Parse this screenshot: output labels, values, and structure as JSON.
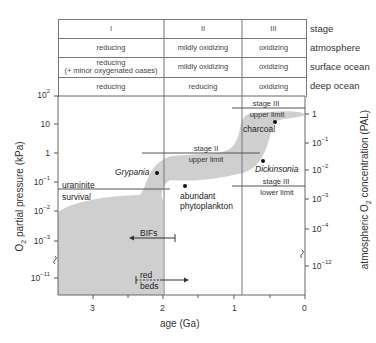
{
  "table": {
    "columns": [
      "I",
      "II",
      "III"
    ],
    "rows": [
      {
        "label": "stage",
        "cells": [
          "I",
          "II",
          "III"
        ]
      },
      {
        "label": "atmosphere",
        "cells": [
          "reducing",
          "mildly oxidizing",
          "oxidizing"
        ]
      },
      {
        "label": "surface ocean",
        "cells": [
          "reducing",
          "mildly oxidizing",
          "oxidizing"
        ],
        "note": "(+ minor oxygenated oases)"
      },
      {
        "label": "deep ocean",
        "cells": [
          "reducing",
          "reducing",
          "oxidizing"
        ]
      }
    ]
  },
  "chart": {
    "xlabel": "age (Ga)",
    "ylabel_left_main": "O",
    "ylabel_left_sub": "2",
    "ylabel_left_rest": " partial pressure (kPa)",
    "ylabel_right_pre": "atmospheric O",
    "ylabel_right_sub": "2",
    "ylabel_right_rest": " concentration (PAL)",
    "x_ticks": [
      "3",
      "2",
      "1",
      "0"
    ],
    "left_ticks": [
      {
        "base": "10",
        "exp": "2"
      },
      {
        "base": "10",
        "exp": ""
      },
      {
        "base": "1",
        "exp": ""
      },
      {
        "base": "10",
        "exp": "−1"
      },
      {
        "base": "10",
        "exp": "−2"
      },
      {
        "base": "10",
        "exp": "−3"
      },
      {
        "base": "10",
        "exp": "−11"
      }
    ],
    "right_ticks": [
      {
        "base": "1",
        "exp": ""
      },
      {
        "base": "10",
        "exp": "−1"
      },
      {
        "base": "10",
        "exp": "−2"
      },
      {
        "base": "10",
        "exp": "−3"
      },
      {
        "base": "10",
        "exp": "−4"
      },
      {
        "base": "10",
        "exp": "−12"
      }
    ],
    "annotations": {
      "uraninite": "uraninite",
      "survival": "survival",
      "grypania": "Grypania",
      "abundant": "abundant",
      "phytoplankton": "phytoplankton",
      "stage2_upper_1": "stage II",
      "stage2_upper_2": "upper limit",
      "stage3_upper_1": "stage III",
      "stage3_upper_2": "upper limit",
      "charcoal": "charcoal",
      "dickinsonia": "Dickinsonia",
      "stage3_lower_1": "stage III",
      "stage3_lower_2": "lower limit",
      "bifs": "BIFs",
      "red": "red",
      "beds": "beds"
    },
    "colors": {
      "band": "#cfcfcf",
      "lines": "#555555"
    }
  }
}
